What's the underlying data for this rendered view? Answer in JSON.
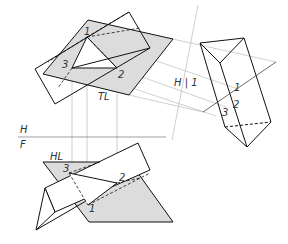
{
  "colors": {
    "line": "#111111",
    "projection": "#aaaaaa",
    "shade": "#dcdcdc"
  },
  "labels": {
    "top_view": {
      "p1": "1",
      "p2": "2",
      "p3": "3",
      "tl": "TL"
    },
    "fold_h1": "H | 1",
    "fold_hf_top": "H",
    "fold_hf_bottom": "F",
    "aux_view": {
      "p1": "1",
      "p2": "2",
      "p3": "3"
    },
    "front_view": {
      "hl": "HL",
      "p1": "1",
      "p2": "2",
      "p3": "3"
    }
  }
}
